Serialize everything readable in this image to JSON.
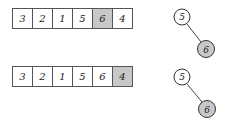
{
  "highlight_color": "#c8c8c8",
  "panels": [
    {
      "array": {
        "cells": [
          {
            "value": "3",
            "highlighted": false
          },
          {
            "value": "2",
            "highlighted": false
          },
          {
            "value": "1",
            "highlighted": false
          },
          {
            "value": "5",
            "highlighted": false
          },
          {
            "value": "6",
            "highlighted": true
          },
          {
            "value": "4",
            "highlighted": false
          }
        ]
      },
      "tree": {
        "nodes": [
          {
            "id": "n5",
            "value": "5",
            "highlighted": false
          },
          {
            "id": "n6",
            "value": "6",
            "highlighted": true
          }
        ],
        "edges": [
          [
            "n5",
            "n6"
          ]
        ]
      }
    },
    {
      "array": {
        "cells": [
          {
            "value": "3",
            "highlighted": false
          },
          {
            "value": "2",
            "highlighted": false
          },
          {
            "value": "1",
            "highlighted": false
          },
          {
            "value": "5",
            "highlighted": false
          },
          {
            "value": "6",
            "highlighted": false
          },
          {
            "value": "4",
            "highlighted": true
          }
        ]
      },
      "tree": {
        "nodes": [
          {
            "id": "n5",
            "value": "5",
            "highlighted": false
          },
          {
            "id": "n6",
            "value": "6",
            "highlighted": true
          }
        ],
        "edges": [
          [
            "n5",
            "n6"
          ]
        ]
      }
    }
  ]
}
